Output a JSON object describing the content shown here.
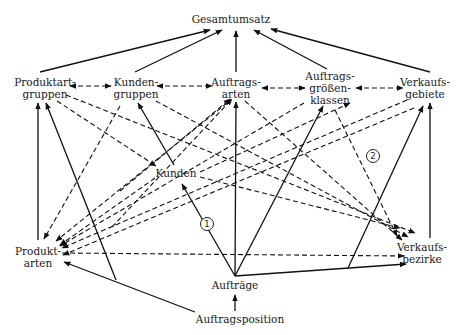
{
  "diagram": {
    "title": "Gesamtumsatz",
    "nodes": {
      "gesamtumsatz": {
        "lines": [
          "Gesamtumsatz"
        ],
        "x": 231,
        "y": 19
      },
      "produktartgruppen": {
        "lines": [
          "Produktart-",
          "gruppen"
        ],
        "x": 45,
        "y": 88
      },
      "kundengruppen": {
        "lines": [
          "Kunden-",
          "gruppen"
        ],
        "x": 136,
        "y": 88
      },
      "auftragsarten": {
        "lines": [
          "Auftrags-",
          "arten"
        ],
        "x": 236,
        "y": 88
      },
      "auftragsgroessenklassen": {
        "lines": [
          "Auftrags-",
          "größen-",
          "klassen"
        ],
        "x": 330,
        "y": 88
      },
      "verkaufsgebiete": {
        "lines": [
          "Verkaufs-",
          "gebiete"
        ],
        "x": 425,
        "y": 88
      },
      "kunden": {
        "lines": [
          "Kunden"
        ],
        "x": 176,
        "y": 173
      },
      "produktarten": {
        "lines": [
          "Produkt-",
          "arten"
        ],
        "x": 38,
        "y": 257
      },
      "verkaufsbezirke": {
        "lines": [
          "Verkaufs-",
          "bezirke"
        ],
        "x": 422,
        "y": 253
      },
      "auftraege": {
        "lines": [
          "Aufträge"
        ],
        "x": 235,
        "y": 285
      },
      "auftragsposition": {
        "lines": [
          "Auftragsposition"
        ],
        "x": 240,
        "y": 319
      }
    },
    "badges": [
      {
        "label": "1",
        "x": 207,
        "y": 224
      },
      {
        "label": "2",
        "x": 373,
        "y": 156
      }
    ],
    "solid_edges": [
      {
        "from": [
          40,
          72
        ],
        "to": [
          210,
          30
        ]
      },
      {
        "from": [
          135,
          72
        ],
        "to": [
          222,
          30
        ]
      },
      {
        "from": [
          236,
          72
        ],
        "to": [
          236,
          31
        ]
      },
      {
        "from": [
          327,
          69
        ],
        "to": [
          254,
          30
        ]
      },
      {
        "from": [
          430,
          72
        ],
        "to": [
          271,
          29
        ]
      },
      {
        "from": [
          38,
          240
        ],
        "to": [
          38,
          103
        ]
      },
      {
        "from": [
          116,
          280
        ],
        "to": [
          46,
          103
        ]
      },
      {
        "from": [
          174,
          165
        ],
        "to": [
          138,
          103
        ]
      },
      {
        "from": [
          235,
          276
        ],
        "to": [
          236,
          102
        ]
      },
      {
        "from": [
          235,
          276
        ],
        "to": [
          323,
          106
        ]
      },
      {
        "from": [
          348,
          268
        ],
        "to": [
          423,
          106
        ]
      },
      {
        "from": [
          430,
          238
        ],
        "to": [
          430,
          103
        ]
      },
      {
        "from": [
          235,
          276
        ],
        "to": [
          182,
          184
        ]
      },
      {
        "from": [
          195,
          312
        ],
        "to": [
          64,
          262
        ]
      },
      {
        "from": [
          235,
          276
        ],
        "to": [
          406,
          264
        ]
      },
      {
        "from": [
          235,
          311
        ],
        "to": [
          235,
          295
        ]
      }
    ],
    "dashed_edges": [
      {
        "from": [
          70,
          86
        ],
        "to": [
          111,
          86
        ],
        "bidirectional": true
      },
      {
        "from": [
          157,
          86
        ],
        "to": [
          212,
          86
        ],
        "bidirectional": true
      },
      {
        "from": [
          262,
          88
        ],
        "to": [
          305,
          88
        ],
        "bidirectional": true
      },
      {
        "from": [
          356,
          88
        ],
        "to": [
          403,
          88
        ],
        "bidirectional": true
      },
      {
        "from": [
          57,
          101
        ],
        "to": [
          156,
          166
        ]
      },
      {
        "from": [
          66,
          95
        ],
        "to": [
          415,
          233
        ]
      },
      {
        "from": [
          156,
          101
        ],
        "to": [
          408,
          237
        ]
      },
      {
        "from": [
          112,
          227
        ],
        "to": [
          232,
          99
        ]
      },
      {
        "from": [
          245,
          101
        ],
        "to": [
          402,
          240
        ]
      },
      {
        "from": [
          335,
          110
        ],
        "to": [
          397,
          236
        ]
      },
      {
        "from": [
          120,
          106
        ],
        "to": [
          44,
          239
        ]
      },
      {
        "from": [
          227,
          103
        ],
        "to": [
          56,
          241
        ]
      },
      {
        "from": [
          304,
          103
        ],
        "to": [
          60,
          246
        ]
      },
      {
        "from": [
          407,
          100
        ],
        "to": [
          62,
          248
        ]
      },
      {
        "from": [
          414,
          108
        ],
        "to": [
          63,
          255
        ]
      },
      {
        "from": [
          155,
          178
        ],
        "to": [
          60,
          245
        ]
      },
      {
        "from": [
          200,
          172
        ],
        "to": [
          350,
          103
        ]
      },
      {
        "from": [
          120,
          191
        ],
        "to": [
          230,
          99
        ]
      },
      {
        "from": [
          200,
          177
        ],
        "to": [
          400,
          228
        ]
      },
      {
        "from": [
          62,
          253
        ],
        "to": [
          404,
          256
        ]
      }
    ]
  }
}
